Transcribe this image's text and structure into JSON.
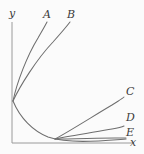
{
  "figure": {
    "background_color": "#fbfbfb",
    "line_color": "#6e6e6e",
    "axis_color": "#9a9a9a",
    "label_color": "#3c3c3c",
    "width": 144,
    "height": 154
  },
  "axes": {
    "y_axis_label": "y",
    "x_axis_label": "x",
    "y_axis_label_pos": {
      "x": 9,
      "y": 8
    },
    "x_axis_label_pos": {
      "x": 130,
      "y": 137
    },
    "origin": {
      "x": 12,
      "y": 143
    },
    "x_axis_end": {
      "x": 134,
      "y": 143
    },
    "y_axis_top": {
      "x": 12,
      "y": 22
    }
  },
  "chart_data": {
    "type": "line",
    "title": "",
    "xlabel": "x",
    "ylabel": "y",
    "grid": false,
    "legend": "inline-curve-end-labels",
    "common_start_point": {
      "x": 13,
      "y": 101
    },
    "crossing_point": {
      "x": 55,
      "y": 139
    },
    "series": [
      {
        "name": "A",
        "label": "A",
        "label_pos": {
          "x": 43,
          "y": 9
        },
        "end_point": {
          "x": 47,
          "y": 22
        },
        "path": "M 13 101 C 17 82 27 56 38 38 C 42 31 45 26 47 22"
      },
      {
        "name": "B",
        "label": "B",
        "label_pos": {
          "x": 67,
          "y": 9
        },
        "end_point": {
          "x": 70,
          "y": 22
        },
        "path": "M 13 101 C 20 86 36 60 53 42 C 61 33 67 26 70 22"
      },
      {
        "name": "C",
        "label": "C",
        "label_pos": {
          "x": 126,
          "y": 86
        },
        "end_point": {
          "x": 124,
          "y": 97
        },
        "path": "M 55 139 C 70 131 95 115 112 105 C 118 101 122 99 124 97"
      },
      {
        "name": "D",
        "label": "D",
        "label_pos": {
          "x": 126,
          "y": 112
        },
        "end_point": {
          "x": 124,
          "y": 126
        },
        "path": "M 55 139 C 70 136 95 132 112 129 C 118 128 122 127 124 126"
      },
      {
        "name": "E",
        "label": "E",
        "label_pos": {
          "x": 126,
          "y": 127
        },
        "end_point": {
          "x": 126,
          "y": 138
        },
        "path": "M 55 139 C 72 139 100 138 115 138 C 121 138 124 138 126 138"
      },
      {
        "name": "descending",
        "label": "",
        "label_pos": null,
        "end_point": {
          "x": 126,
          "y": 139
        },
        "path": "M 13 101 C 20 118 33 131 48 137 C 70 144 100 141 126 139"
      }
    ]
  }
}
